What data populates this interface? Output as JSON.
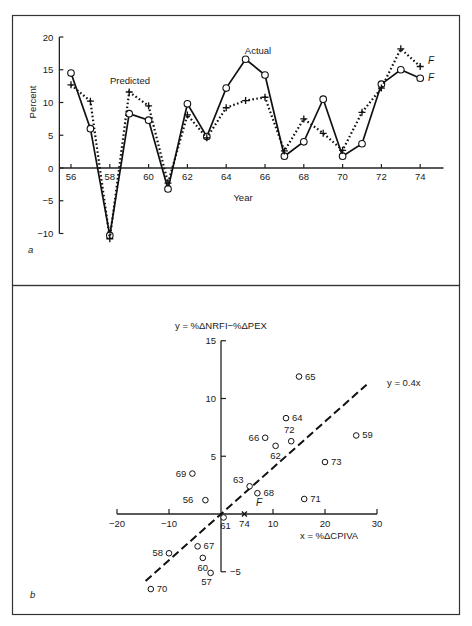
{
  "chart_data": [
    {
      "panel": "a",
      "type": "line",
      "title": "",
      "xlabel": "Year",
      "ylabel": "Percent",
      "xlim": [
        55.5,
        75.2
      ],
      "ylim": [
        -10,
        20
      ],
      "x_ticks": [
        56,
        58,
        60,
        62,
        64,
        66,
        68,
        70,
        72,
        74
      ],
      "y_ticks": [
        -10,
        -5,
        0,
        5,
        10,
        15,
        20
      ],
      "grid": false,
      "x": [
        56,
        57,
        58,
        59,
        60,
        61,
        62,
        63,
        64,
        65,
        66,
        67,
        68,
        69,
        70,
        71,
        72,
        73,
        74
      ],
      "series": [
        {
          "name": "Actual",
          "style": "solid line, open circle markers",
          "values": [
            14.5,
            6,
            -10.3,
            8.3,
            7.3,
            -3.2,
            9.8,
            4.8,
            12.2,
            16.6,
            14.2,
            1.8,
            4,
            10.5,
            1.8,
            3.7,
            12.8,
            15,
            13.7
          ]
        },
        {
          "name": "Predicted",
          "style": "dotted line, plus markers",
          "values": [
            12.7,
            10.2,
            -10.8,
            11.6,
            9.5,
            -2.3,
            8.1,
            4.6,
            9.2,
            10.3,
            10.8,
            2.6,
            7.5,
            5.3,
            2.7,
            8.5,
            12.2,
            18.2,
            15.5
          ]
        }
      ],
      "annotations": [
        {
          "text": "Predicted",
          "near": [
            60,
            12.5
          ]
        },
        {
          "text": "Actual",
          "near": [
            65,
            17.5
          ]
        },
        {
          "text": "F",
          "near": [
            74,
            15.5
          ],
          "series": "Predicted",
          "meaning": "forecast"
        },
        {
          "text": "F",
          "near": [
            74,
            13.7
          ],
          "series": "Actual",
          "meaning": "forecast"
        }
      ],
      "panel_label": "a"
    },
    {
      "panel": "b",
      "type": "scatter",
      "title": "",
      "xlabel": "x = %ΔCPIVA",
      "ylabel": "y = %ΔNRFI−%ΔPEX",
      "xlim": [
        -20,
        30
      ],
      "ylim": [
        -5,
        15
      ],
      "x_ticks": [
        -20,
        -10,
        10,
        20,
        30
      ],
      "y_ticks": [
        -5,
        5,
        10,
        15
      ],
      "grid": false,
      "points": [
        {
          "label": "56",
          "x": -3,
          "y": 1.2
        },
        {
          "label": "57",
          "x": -2,
          "y": -5.1
        },
        {
          "label": "58",
          "x": -10,
          "y": -3.4
        },
        {
          "label": "59",
          "x": 26,
          "y": 6.8
        },
        {
          "label": "60",
          "x": -3.5,
          "y": -3.8
        },
        {
          "label": "61",
          "x": 0.5,
          "y": -0.3
        },
        {
          "label": "62",
          "x": 10.5,
          "y": 5.9
        },
        {
          "label": "63",
          "x": 5.5,
          "y": 2.4
        },
        {
          "label": "64",
          "x": 12.5,
          "y": 8.3
        },
        {
          "label": "65",
          "x": 15,
          "y": 11.9
        },
        {
          "label": "66",
          "x": 8.5,
          "y": 6.6
        },
        {
          "label": "67",
          "x": -4.5,
          "y": -2.8
        },
        {
          "label": "68",
          "x": 7,
          "y": 1.8
        },
        {
          "label": "69",
          "x": -5.5,
          "y": 3.5
        },
        {
          "label": "70",
          "x": -13.5,
          "y": -6.5
        },
        {
          "label": "71",
          "x": 16,
          "y": 1.3
        },
        {
          "label": "72",
          "x": 13.5,
          "y": 6.3
        },
        {
          "label": "73",
          "x": 20,
          "y": 4.5
        }
      ],
      "forecast_point": {
        "label": "74",
        "marker": "x",
        "annotation": "F",
        "x": 4.5,
        "y": 0
      },
      "fit_line": {
        "label": "y = 0.4x",
        "slope": 0.4,
        "intercept": 0,
        "x_range": [
          -14.5,
          28
        ],
        "style": "dashed"
      },
      "panel_label": "b"
    }
  ],
  "labels": {
    "a_ylabel": "Percent",
    "a_xlabel": "Year",
    "a_predicted": "Predicted",
    "a_actual": "Actual",
    "a_F": "F",
    "a_panel": "a",
    "b_ylabel": "y = %ΔNRFI−%ΔPEX",
    "b_xlabel": "x = %ΔCPIVA",
    "b_fit": "y = 0.4x",
    "b_F": "F",
    "b_panel": "b"
  }
}
